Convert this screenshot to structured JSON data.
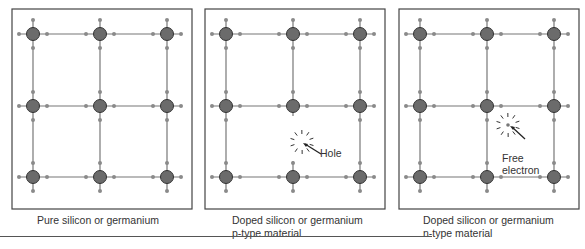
{
  "panels": [
    {
      "id": "pure",
      "caption_line1": "Pure silicon or germanium",
      "caption_line2": "",
      "x": 12,
      "label": ""
    },
    {
      "id": "p-type",
      "caption_line1": "Doped silicon or germanium",
      "caption_line2": "p-type material",
      "x": 205,
      "label": "Hole"
    },
    {
      "id": "n-type",
      "caption_line1": "Doped silicon or germanium",
      "caption_line2": "n-type material",
      "x": 399,
      "label_line1": "Free",
      "label_line2": "electron"
    }
  ],
  "colors": {
    "atom": "#6b6b6b",
    "bond": "#777777",
    "electron": "#8a8a8a",
    "frame": "#444444"
  }
}
